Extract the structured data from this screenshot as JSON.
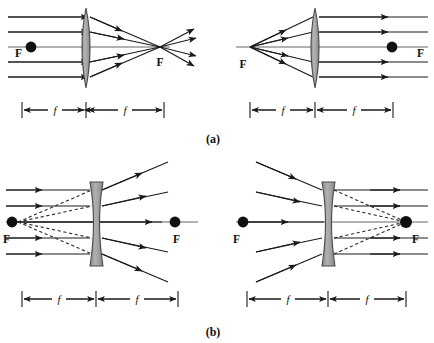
{
  "figure": {
    "title_alt": "Ray diagrams for converging and diverging lenses",
    "background_color": "#ffffff",
    "ink_color": "#101010",
    "ray_color": "#1a1a1a",
    "axis_color": "#555555",
    "lens_fill": "#9e9e9e",
    "lens_stroke": "#4a4a4a",
    "dash_color": "#2a2a2a"
  },
  "captions": [
    {
      "id": "caption-a",
      "text": "(a)",
      "x": 213,
      "y": 143
    },
    {
      "id": "caption-b",
      "text": "(b)",
      "x": 213,
      "y": 336
    }
  ],
  "panels": [
    {
      "id": "panel-a-left",
      "lens_type": "converging",
      "description": "Parallel rays converge to focal point F on the right",
      "focal_labels": [
        {
          "text": "F",
          "x": 15,
          "y": 57,
          "has_dot": true,
          "dot_x": 31,
          "dot_y": 47
        },
        {
          "text": "F",
          "x": 160,
          "y": 66,
          "has_dot": false,
          "dot_x": 0,
          "dot_y": 0
        }
      ],
      "dimension": {
        "label_left": "f",
        "label_right": "f"
      }
    },
    {
      "id": "panel-a-right",
      "lens_type": "converging",
      "description": "Rays from focal point F emerge parallel",
      "focal_labels": [
        {
          "text": "F",
          "x": 243,
          "y": 68,
          "has_dot": false,
          "dot_x": 0,
          "dot_y": 0
        },
        {
          "text": "F",
          "x": 417,
          "y": 57,
          "has_dot": true,
          "dot_x": 392,
          "dot_y": 47
        }
      ],
      "dimension": {
        "label_left": "f",
        "label_right": "f"
      }
    },
    {
      "id": "panel-b-left",
      "lens_type": "diverging",
      "description": "Parallel rays diverge as if from virtual focal point F on the left",
      "focal_labels": [
        {
          "text": "F",
          "x": 3,
          "y": 243,
          "has_dot": true,
          "dot_x": 12,
          "dot_y": 222
        },
        {
          "text": "F",
          "x": 173,
          "y": 243,
          "has_dot": true,
          "dot_x": 175,
          "dot_y": 222
        }
      ],
      "dimension": {
        "label_left": "f",
        "label_right": "f"
      }
    },
    {
      "id": "panel-b-right",
      "lens_type": "diverging",
      "description": "Rays aimed at virtual focal point F emerge parallel",
      "focal_labels": [
        {
          "text": "F",
          "x": 233,
          "y": 243,
          "has_dot": true,
          "dot_x": 243,
          "dot_y": 222
        },
        {
          "text": "F",
          "x": 412,
          "y": 243,
          "has_dot": true,
          "dot_x": 406,
          "dot_y": 222
        }
      ],
      "dimension": {
        "label_left": "f",
        "label_right": "f"
      }
    }
  ],
  "dimension_bars": [
    {
      "id": "dimbar-a-left",
      "segments": [
        "f",
        "f"
      ],
      "y": 110
    },
    {
      "id": "dimbar-a-right",
      "segments": [
        "f",
        "f"
      ],
      "y": 110
    },
    {
      "id": "dimbar-b-left",
      "segments": [
        "f",
        "f"
      ],
      "y": 299
    },
    {
      "id": "dimbar-b-right",
      "segments": [
        "f",
        "f"
      ],
      "y": 299
    }
  ]
}
